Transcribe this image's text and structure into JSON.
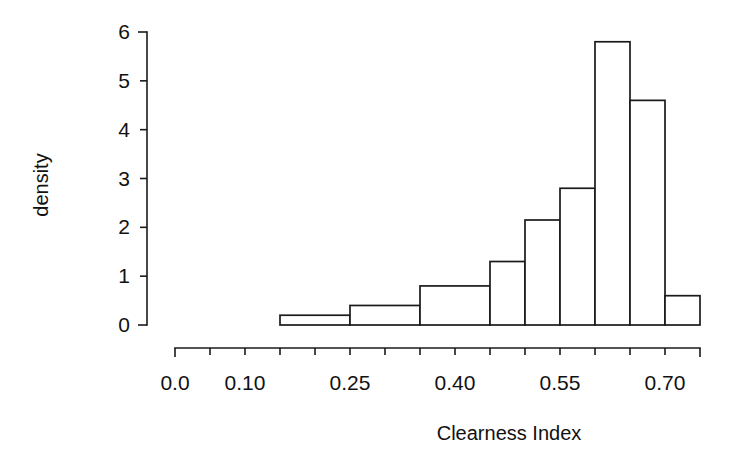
{
  "chart_data": {
    "type": "bar",
    "title": "",
    "subtitle": "",
    "xlabel": "Clearness Index",
    "ylabel": "density",
    "grid": false,
    "legend": false,
    "legend_position": "none",
    "xlim": [
      0.0,
      0.75
    ],
    "ylim": [
      0,
      6
    ],
    "x_tick_labels": [
      "0.0",
      "0.10",
      "0.25",
      "0.40",
      "0.55",
      "0.70"
    ],
    "x_tick_values": [
      0.0,
      0.1,
      0.25,
      0.4,
      0.55,
      0.7
    ],
    "x_minor_tick_values": [
      0.05,
      0.15,
      0.2,
      0.3,
      0.35,
      0.45,
      0.5,
      0.6,
      0.65,
      0.75
    ],
    "y_tick_labels": [
      "0",
      "1",
      "2",
      "3",
      "4",
      "5",
      "6"
    ],
    "y_tick_values": [
      0,
      1,
      2,
      3,
      4,
      5,
      6
    ],
    "bin_edges": [
      0.15,
      0.25,
      0.35,
      0.4,
      0.45,
      0.5,
      0.55,
      0.6,
      0.65,
      0.7,
      0.75
    ],
    "bars": [
      {
        "x0": 0.15,
        "x1": 0.25,
        "height": 0.2
      },
      {
        "x0": 0.25,
        "x1": 0.35,
        "height": 0.4
      },
      {
        "x0": 0.35,
        "x1": 0.45,
        "height": 0.8
      },
      {
        "x0": 0.45,
        "x1": 0.5,
        "height": 1.3
      },
      {
        "x0": 0.5,
        "x1": 0.55,
        "height": 2.15
      },
      {
        "x0": 0.55,
        "x1": 0.6,
        "height": 2.8
      },
      {
        "x0": 0.6,
        "x1": 0.65,
        "height": 5.8
      },
      {
        "x0": 0.65,
        "x1": 0.7,
        "height": 4.6
      },
      {
        "x0": 0.7,
        "x1": 0.75,
        "height": 0.6
      }
    ],
    "categories": [
      "0.15-0.25",
      "0.25-0.35",
      "0.35-0.45",
      "0.45-0.50",
      "0.50-0.55",
      "0.55-0.60",
      "0.60-0.65",
      "0.65-0.70",
      "0.70-0.75"
    ],
    "values": [
      0.2,
      0.4,
      0.8,
      1.3,
      2.15,
      2.8,
      5.8,
      4.6,
      0.6
    ],
    "colors": {
      "bar_fill": "#ffffff",
      "bar_stroke": "#1a1a1a",
      "axis": "#1a1a1a",
      "text": "#111111",
      "background": "#ffffff"
    }
  }
}
